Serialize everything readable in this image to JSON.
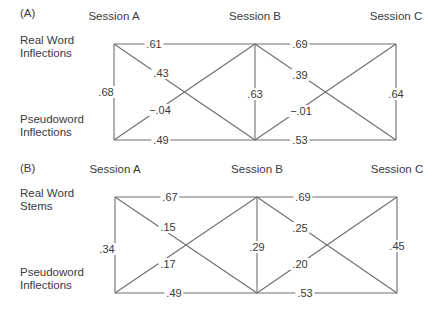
{
  "colors": {
    "line": "#6e6e6e",
    "text": "#3a3a3a",
    "background": "#ffffff"
  },
  "panels": [
    {
      "id": "A",
      "label": "(A)",
      "label_pos": [
        20,
        13
      ],
      "sessions": [
        {
          "label": "Session A",
          "x": 114,
          "label_y": 16
        },
        {
          "label": "Session B",
          "x": 255,
          "label_y": 16
        },
        {
          "label": "Session C",
          "x": 396,
          "label_y": 16
        }
      ],
      "top_y": 44,
      "bottom_y": 140,
      "rows": [
        {
          "lines": [
            "Real Word",
            "Inflections"
          ],
          "x": 20,
          "y": 40
        },
        {
          "lines": [
            "Pseudoword",
            "Inflections"
          ],
          "x": 20,
          "y": 119
        }
      ],
      "edges": [
        {
          "from": [
            "A",
            "top"
          ],
          "to": [
            "B",
            "top"
          ],
          "value": ".61",
          "lx": 154,
          "ly": 44
        },
        {
          "from": [
            "B",
            "top"
          ],
          "to": [
            "C",
            "top"
          ],
          "value": ".69",
          "lx": 300,
          "ly": 44
        },
        {
          "from": [
            "A",
            "bottom"
          ],
          "to": [
            "B",
            "bottom"
          ],
          "value": ".49",
          "lx": 161,
          "ly": 140
        },
        {
          "from": [
            "B",
            "bottom"
          ],
          "to": [
            "C",
            "bottom"
          ],
          "value": ".53",
          "lx": 300,
          "ly": 140
        },
        {
          "from": [
            "A",
            "top"
          ],
          "to": [
            "A",
            "bottom"
          ],
          "value": ".68",
          "lx": 106,
          "ly": 92
        },
        {
          "from": [
            "B",
            "top"
          ],
          "to": [
            "B",
            "bottom"
          ],
          "value": ".63",
          "lx": 255,
          "ly": 94
        },
        {
          "from": [
            "C",
            "top"
          ],
          "to": [
            "C",
            "bottom"
          ],
          "value": ".64",
          "lx": 396,
          "ly": 94
        },
        {
          "from": [
            "A",
            "top"
          ],
          "to": [
            "B",
            "bottom"
          ],
          "value": ".43",
          "lx": 161,
          "ly": 73
        },
        {
          "from": [
            "A",
            "bottom"
          ],
          "to": [
            "B",
            "top"
          ],
          "value": "−.04",
          "lx": 160,
          "ly": 110
        },
        {
          "from": [
            "B",
            "top"
          ],
          "to": [
            "C",
            "bottom"
          ],
          "value": ".39",
          "lx": 300,
          "ly": 75
        },
        {
          "from": [
            "B",
            "bottom"
          ],
          "to": [
            "C",
            "top"
          ],
          "value": "−.01",
          "lx": 301,
          "ly": 111
        }
      ]
    },
    {
      "id": "B",
      "label": "(B)",
      "label_pos": [
        20,
        168
      ],
      "sessions": [
        {
          "label": "Session A",
          "x": 115,
          "label_y": 169
        },
        {
          "label": "Session B",
          "x": 257,
          "label_y": 169
        },
        {
          "label": "Session C",
          "x": 397,
          "label_y": 169
        }
      ],
      "top_y": 197,
      "bottom_y": 293,
      "rows": [
        {
          "lines": [
            "Real Word",
            "Stems"
          ],
          "x": 20,
          "y": 193
        },
        {
          "lines": [
            "Pseudoword",
            "Inflections"
          ],
          "x": 20,
          "y": 272
        }
      ],
      "edges": [
        {
          "from": [
            "A",
            "top"
          ],
          "to": [
            "B",
            "top"
          ],
          "value": ".67",
          "lx": 170,
          "ly": 197
        },
        {
          "from": [
            "B",
            "top"
          ],
          "to": [
            "C",
            "top"
          ],
          "value": ".69",
          "lx": 303,
          "ly": 197
        },
        {
          "from": [
            "A",
            "bottom"
          ],
          "to": [
            "B",
            "bottom"
          ],
          "value": ".49",
          "lx": 174,
          "ly": 293
        },
        {
          "from": [
            "B",
            "bottom"
          ],
          "to": [
            "C",
            "bottom"
          ],
          "value": ".53",
          "lx": 305,
          "ly": 293
        },
        {
          "from": [
            "A",
            "top"
          ],
          "to": [
            "A",
            "bottom"
          ],
          "value": ".34",
          "lx": 107,
          "ly": 249
        },
        {
          "from": [
            "B",
            "top"
          ],
          "to": [
            "B",
            "bottom"
          ],
          "value": ".29",
          "lx": 257,
          "ly": 247
        },
        {
          "from": [
            "C",
            "top"
          ],
          "to": [
            "C",
            "bottom"
          ],
          "value": ".45",
          "lx": 397,
          "ly": 246
        },
        {
          "from": [
            "A",
            "top"
          ],
          "to": [
            "B",
            "bottom"
          ],
          "value": ".15",
          "lx": 168,
          "ly": 227
        },
        {
          "from": [
            "A",
            "bottom"
          ],
          "to": [
            "B",
            "top"
          ],
          "value": ".17",
          "lx": 168,
          "ly": 264
        },
        {
          "from": [
            "B",
            "top"
          ],
          "to": [
            "C",
            "bottom"
          ],
          "value": ".25",
          "lx": 300,
          "ly": 228
        },
        {
          "from": [
            "B",
            "bottom"
          ],
          "to": [
            "C",
            "top"
          ],
          "value": ".20",
          "lx": 300,
          "ly": 264
        }
      ]
    }
  ]
}
